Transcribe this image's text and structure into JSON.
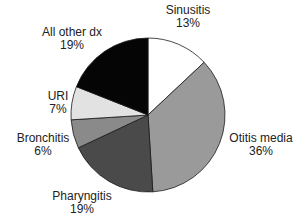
{
  "chart_data": {
    "type": "pie",
    "title": "",
    "start_angle_deg": 0,
    "direction": "clockwise",
    "slices": [
      {
        "label": "Sinusitis",
        "value": 13,
        "pct_label": "13%",
        "color": "#ffffff"
      },
      {
        "label": "Otitis media",
        "value": 36,
        "pct_label": "36%",
        "color": "#9a9a9a"
      },
      {
        "label": "Pharyngitis",
        "value": 19,
        "pct_label": "19%",
        "color": "#4a4a4a"
      },
      {
        "label": "Bronchitis",
        "value": 6,
        "pct_label": "6%",
        "color": "#8a8a8a"
      },
      {
        "label": "URI",
        "value": 7,
        "pct_label": "7%",
        "color": "#e2e2e2"
      },
      {
        "label": "All other dx",
        "value": 19,
        "pct_label": "19%",
        "color": "#050505"
      }
    ]
  },
  "labels": [
    {
      "name": "Sinusitis",
      "pct": "13%",
      "x": 188,
      "y": 4
    },
    {
      "name": "Otitis media",
      "pct": "36%",
      "x": 261,
      "y": 132
    },
    {
      "name": "Pharyngitis",
      "pct": "19%",
      "x": 82,
      "y": 190
    },
    {
      "name": "Bronchitis",
      "pct": "6%",
      "x": 43,
      "y": 132
    },
    {
      "name": "URI",
      "pct": "7%",
      "x": 58,
      "y": 90
    },
    {
      "name": "All other dx",
      "pct": "19%",
      "x": 72,
      "y": 26
    }
  ]
}
